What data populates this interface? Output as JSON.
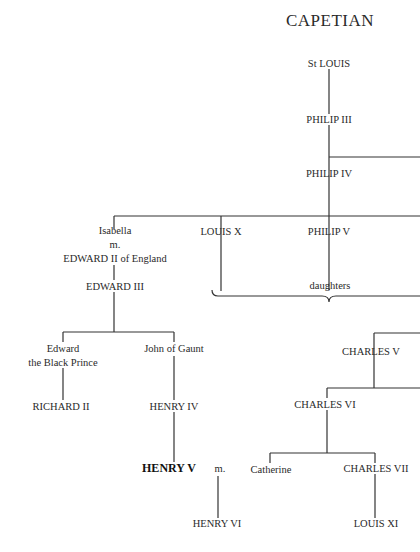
{
  "title": "CAPETIAN",
  "nodes": {
    "st_louis": "St LOUIS",
    "philip_iii": "PHILIP III",
    "philip_iv": "PHILIP IV",
    "isabella": "Isabella",
    "isabella_m": "m.",
    "edward_ii": "EDWARD II of England",
    "louis_x": "LOUIS X",
    "philip_v": "PHILIP V",
    "daughters": "daughters",
    "edward_iii": "EDWARD III",
    "black_prince_1": "Edward",
    "black_prince_2": "the Black Prince",
    "john_of_gaunt": "John of Gaunt",
    "richard_ii": "RICHARD II",
    "henry_iv": "HENRY IV",
    "henry_v": "HENRY V",
    "henry_v_m": "m.",
    "henry_vi": "HENRY VI",
    "charles_v": "CHARLES V",
    "charles_vi": "CHARLES VI",
    "catherine": "Catherine",
    "charles_vii": "CHARLES VII",
    "louis_xi": "LOUIS XI"
  }
}
